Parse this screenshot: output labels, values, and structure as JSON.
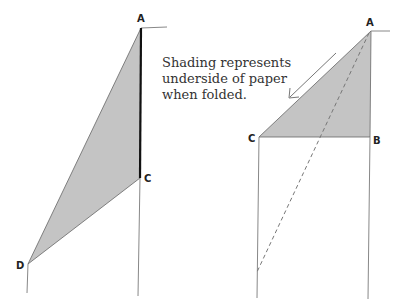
{
  "diagram": {
    "note_lines": [
      "Shading represents",
      "underside of paper",
      "when folded."
    ],
    "colors": {
      "shading": "#c4c4c4",
      "line": "#777777",
      "edge_bold": "#111111",
      "text": "#333333"
    },
    "left_figure": {
      "labels": {
        "A": "A",
        "C": "C",
        "D": "D"
      },
      "points": {
        "A": [
          141,
          28
        ],
        "C": [
          140,
          178
        ],
        "D": [
          28,
          264
        ]
      }
    },
    "right_figure": {
      "labels": {
        "A": "A",
        "B": "B",
        "C": "C"
      },
      "points": {
        "A": [
          371,
          31
        ],
        "B": [
          370,
          137
        ],
        "C": [
          259,
          137
        ]
      },
      "fold_arrow_direction": "toward C"
    }
  }
}
